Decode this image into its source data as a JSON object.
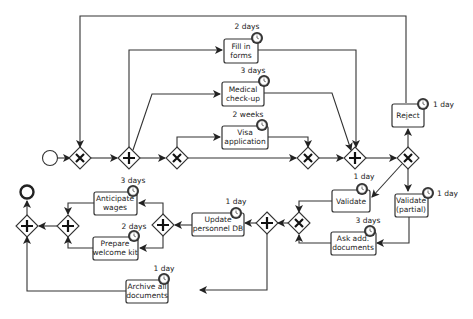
{
  "diagram": {
    "type": "BPMN process",
    "tasks": [
      {
        "id": "fill_forms",
        "line1": "Fill in",
        "line2": "forms",
        "duration": "2 days"
      },
      {
        "id": "medical",
        "line1": "Medical",
        "line2": "check-up",
        "duration": "3 days"
      },
      {
        "id": "visa",
        "line1": "Visa",
        "line2": "application",
        "duration": "2 weeks"
      },
      {
        "id": "reject",
        "line1": "Reject",
        "line2": "",
        "duration": "1 day"
      },
      {
        "id": "validate",
        "line1": "Validate",
        "line2": "",
        "duration": "1 day"
      },
      {
        "id": "validate_partial",
        "line1": "Validate",
        "line2": "(partial)",
        "duration": "1 day"
      },
      {
        "id": "ask_docs",
        "line1": "Ask add.",
        "line2": "documents",
        "duration": "3 days"
      },
      {
        "id": "update_db",
        "line1": "Update",
        "line2": "personnel DB",
        "duration": "1 day"
      },
      {
        "id": "anticipate",
        "line1": "Anticipate",
        "line2": "wages",
        "duration": "3 days"
      },
      {
        "id": "welcome_kit",
        "line1": "Prepare",
        "line2": "welcome kit",
        "duration": "2 days"
      },
      {
        "id": "archive",
        "line1": "Archive all",
        "line2": "documents",
        "duration": "1 day"
      }
    ],
    "gateways": [
      {
        "id": "g_merge_start",
        "kind": "exclusive"
      },
      {
        "id": "g_fork",
        "kind": "parallel"
      },
      {
        "id": "g_visa_split",
        "kind": "exclusive"
      },
      {
        "id": "g_visa_merge",
        "kind": "exclusive"
      },
      {
        "id": "g_join",
        "kind": "parallel"
      },
      {
        "id": "g_decision",
        "kind": "exclusive"
      },
      {
        "id": "g_validate_merge",
        "kind": "exclusive"
      },
      {
        "id": "g_fork2",
        "kind": "parallel"
      },
      {
        "id": "g_fork3",
        "kind": "parallel"
      },
      {
        "id": "g_join3",
        "kind": "parallel"
      },
      {
        "id": "g_join_final",
        "kind": "parallel"
      }
    ],
    "events": [
      {
        "id": "start",
        "kind": "start"
      },
      {
        "id": "end",
        "kind": "end"
      }
    ]
  }
}
